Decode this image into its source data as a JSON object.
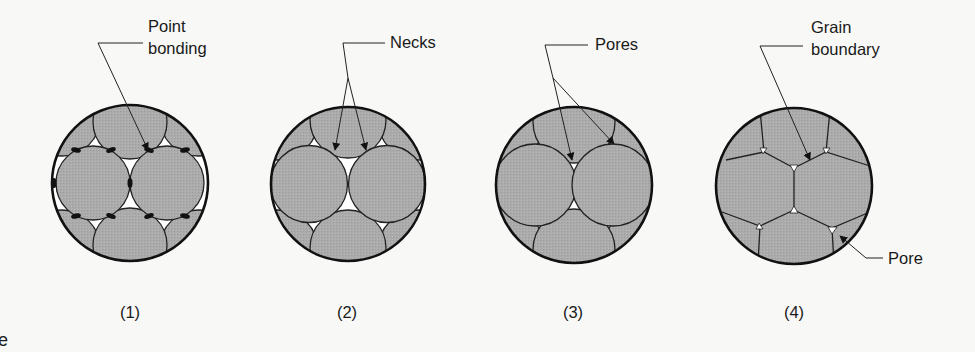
{
  "figure": {
    "colors": {
      "background": "#f8f8f6",
      "particle_fill": "#ababab",
      "outline": "#111111",
      "pore": "#ffffff"
    },
    "stages": [
      {
        "caption": "(1)",
        "labels": [
          "Point",
          "bonding"
        ],
        "description": "Loose particles touching at points; dark point-bond contacts"
      },
      {
        "caption": "(2)",
        "labels": [
          "Necks"
        ],
        "description": "Necks form between particles"
      },
      {
        "caption": "(3)",
        "labels": [
          "Pores"
        ],
        "description": "Particles merge; isolated pores remain"
      },
      {
        "caption": "(4)",
        "labels": [
          "Grain",
          "boundary"
        ],
        "extra_label": "Pore",
        "description": "Polygonal grains with grain boundaries and small residual pores"
      }
    ],
    "edge_fragment": "e"
  }
}
